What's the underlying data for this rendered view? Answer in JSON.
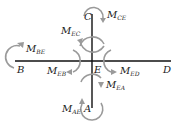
{
  "diagram": {
    "title": "",
    "colors": {
      "member": "#111111",
      "moment_arrow": "#9a9a9a",
      "text": "#1a1a1a"
    },
    "joints": [
      {
        "id": "B",
        "label": "B"
      },
      {
        "id": "C",
        "label": "C"
      },
      {
        "id": "D",
        "label": "D"
      },
      {
        "id": "E",
        "label": "E"
      },
      {
        "id": "A",
        "label": "A"
      }
    ],
    "members": [
      {
        "from": "B",
        "to": "D",
        "orientation": "horizontal"
      },
      {
        "from": "C",
        "to": "A",
        "orientation": "vertical"
      }
    ],
    "moments": [
      {
        "id": "M_CE",
        "main": "M",
        "sub": "CE"
      },
      {
        "id": "M_EC",
        "main": "M",
        "sub": "EC"
      },
      {
        "id": "M_BE",
        "main": "M",
        "sub": "BE"
      },
      {
        "id": "M_EB",
        "main": "M",
        "sub": "EB"
      },
      {
        "id": "M_ED",
        "main": "M",
        "sub": "ED"
      },
      {
        "id": "M_EA",
        "main": "M",
        "sub": "EA"
      },
      {
        "id": "M_AE",
        "main": "M",
        "sub": "AE"
      }
    ]
  }
}
